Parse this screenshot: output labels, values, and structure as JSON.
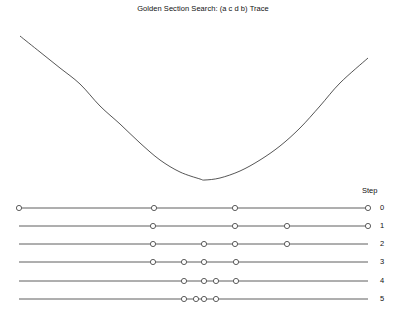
{
  "title": "Golden Section Search: (a c d b) Trace",
  "step_header": {
    "label": "Step",
    "x": 362,
    "y": 186
  },
  "colors": {
    "background": "#ffffff",
    "curve": "#2b2b2b",
    "trace_line": "#4d4d4d",
    "marker_stroke": "#4d4d4d",
    "marker_fill": "#ffffff",
    "text": "#111111"
  },
  "chart_data": {
    "type": "line",
    "title": "Golden Section Search: (a c d b) Trace",
    "xlabel": "",
    "ylabel": "",
    "grid": false,
    "legend": null,
    "annotations": [
      "Step"
    ],
    "curve": {
      "name": "objective function f(x)",
      "kind": "parabola",
      "x_pixel_range": [
        20,
        368
      ],
      "y_pixel_min": 180,
      "vertex_x_pixel": 205,
      "left_end_y_pixel": 36,
      "right_end_y_pixel": 58,
      "samples_x": [
        20,
        40,
        60,
        80,
        100,
        120,
        140,
        160,
        180,
        200,
        205,
        220,
        240,
        260,
        280,
        300,
        320,
        340,
        368
      ],
      "samples_y": [
        36,
        52,
        68,
        84,
        106,
        124,
        143,
        160,
        172,
        179,
        180,
        178,
        171,
        160,
        146,
        128,
        106,
        83,
        58
      ]
    },
    "steps": [
      {
        "step": 0,
        "y_pixel": 208,
        "line_from": 19,
        "line_to": 368,
        "points": [
          {
            "label": "a",
            "x": 19
          },
          {
            "label": "c",
            "x": 154
          },
          {
            "label": "d",
            "x": 235
          },
          {
            "label": "b",
            "x": 368
          }
        ]
      },
      {
        "step": 1,
        "y_pixel": 226,
        "line_from": 19,
        "line_to": 368,
        "points": [
          {
            "label": "a",
            "x": 153
          },
          {
            "label": "c",
            "x": 235
          },
          {
            "label": "d",
            "x": 287
          },
          {
            "label": "b",
            "x": 368
          }
        ]
      },
      {
        "step": 2,
        "y_pixel": 244,
        "line_from": 19,
        "line_to": 368,
        "points": [
          {
            "label": "a",
            "x": 153
          },
          {
            "label": "c",
            "x": 204
          },
          {
            "label": "d",
            "x": 235
          },
          {
            "label": "b",
            "x": 287
          }
        ]
      },
      {
        "step": 3,
        "y_pixel": 262,
        "line_from": 19,
        "line_to": 368,
        "points": [
          {
            "label": "a",
            "x": 153
          },
          {
            "label": "c",
            "x": 184
          },
          {
            "label": "d",
            "x": 204
          },
          {
            "label": "b",
            "x": 236
          }
        ]
      },
      {
        "step": 4,
        "y_pixel": 281,
        "line_from": 19,
        "line_to": 368,
        "points": [
          {
            "label": "a",
            "x": 184
          },
          {
            "label": "c",
            "x": 204
          },
          {
            "label": "d",
            "x": 216
          },
          {
            "label": "b",
            "x": 236
          }
        ]
      },
      {
        "step": 5,
        "y_pixel": 299,
        "line_from": 19,
        "line_to": 368,
        "points": [
          {
            "label": "a",
            "x": 184
          },
          {
            "label": "c",
            "x": 196
          },
          {
            "label": "d",
            "x": 204
          },
          {
            "label": "b",
            "x": 216
          }
        ]
      }
    ],
    "step_labels": [
      "0",
      "1",
      "2",
      "3",
      "4",
      "5"
    ],
    "step_label_x_pixel": 380
  }
}
